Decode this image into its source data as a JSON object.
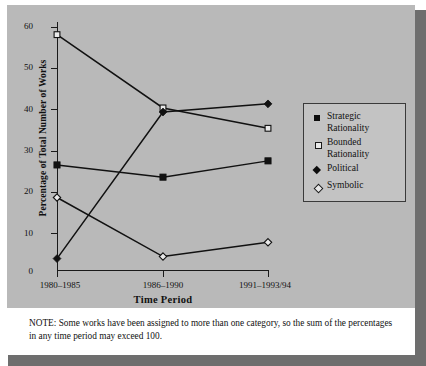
{
  "chart_data": {
    "type": "line",
    "title": "",
    "xlabel": "Time Period",
    "ylabel": "Percentage of Total Number of Works",
    "categories": [
      "1980–1985",
      "1986–1990",
      "1991–1993/94"
    ],
    "ylim": [
      0,
      60
    ],
    "yticks": [
      0,
      10,
      20,
      30,
      40,
      50,
      60
    ],
    "grid": false,
    "legend_position": "right",
    "series": [
      {
        "name": "Strategic Rationality",
        "marker": "filled-square",
        "values": [
          26,
          23,
          27
        ]
      },
      {
        "name": "Bounded Rationality",
        "marker": "open-square",
        "values": [
          58,
          40,
          35
        ]
      },
      {
        "name": "Political",
        "marker": "filled-diamond",
        "values": [
          3,
          39,
          41
        ]
      },
      {
        "name": "Symbolic",
        "marker": "open-diamond",
        "values": [
          18,
          3.5,
          7
        ]
      }
    ],
    "annotations": [
      "NOTE: Some works have been assigned to more than one category, so the sum of the percentages in any time period may exceed 100."
    ]
  },
  "axes": {
    "y_title": "Percentage of Total Number of Works",
    "x_title": "Time Period",
    "y_tick_labels": [
      "60",
      "50",
      "40",
      "30",
      "20",
      "10",
      "0"
    ],
    "x_tick_labels": [
      "1980–1985",
      "1986–1990",
      "1991–1993/94"
    ]
  },
  "legend": {
    "entries": [
      {
        "label": "Strategic Rationality",
        "marker": "filled-square"
      },
      {
        "label": "Bounded Rationality",
        "marker": "open-square"
      },
      {
        "label": "Political",
        "marker": "filled-diamond"
      },
      {
        "label": "Symbolic",
        "marker": "open-diamond"
      }
    ]
  },
  "note": {
    "text": "NOTE:  Some works have been assigned to more than one category, so the sum of the percentages in any time period may exceed 100."
  },
  "colors": {
    "panel_background": "#b9b9b9",
    "page_background": "#ffffff",
    "shadow": "#6e6e6e",
    "ink": "#111111",
    "marker_fill_open": "#e9e9e9"
  }
}
